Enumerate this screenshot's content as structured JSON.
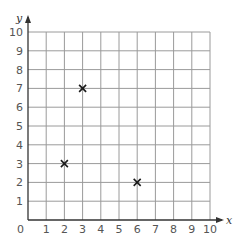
{
  "chart_data": {
    "type": "scatter",
    "title": "",
    "xlabel": "x",
    "ylabel": "y",
    "xlim": [
      0,
      10
    ],
    "ylim": [
      0,
      10
    ],
    "grid": true,
    "x_ticks": [
      "1",
      "2",
      "3",
      "4",
      "5",
      "6",
      "7",
      "8",
      "9",
      "10"
    ],
    "y_ticks": [
      "1",
      "2",
      "3",
      "4",
      "5",
      "6",
      "7",
      "8",
      "9",
      "10"
    ],
    "origin_label": "0",
    "marker": "x",
    "points": [
      {
        "x": 2,
        "y": 3
      },
      {
        "x": 3,
        "y": 7
      },
      {
        "x": 6,
        "y": 2
      }
    ]
  },
  "colors": {
    "grid": "#9a9a9a",
    "axis": "#333333",
    "marker": "#1a1a1a",
    "tick_text": "#555555"
  }
}
